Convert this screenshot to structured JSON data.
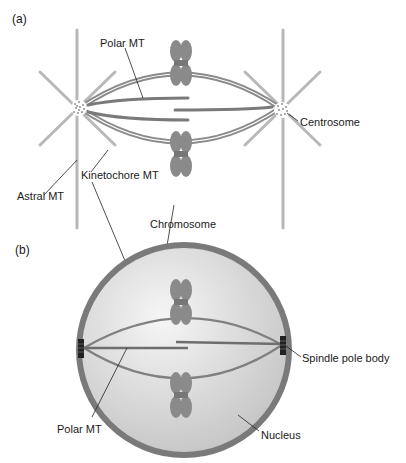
{
  "panels": {
    "a": {
      "label": "(a)",
      "labels": {
        "polar_mt": "Polar MT",
        "centrosome": "Centrosome",
        "astral_mt": "Astral MT",
        "kinetochore_mt": "Kinetochore MT",
        "chromosome": "Chromosome"
      }
    },
    "b": {
      "label": "(b)",
      "labels": {
        "spindle_pole_body": "Spindle pole body",
        "polar_mt": "Polar MT",
        "nucleus": "Nucleus"
      }
    }
  },
  "colors": {
    "microtubule": "#7f7f7f",
    "microtubule_light": "#b5b5b5",
    "chromosome": "#8a8a8a",
    "nuclear_envelope": "#7a7a7a",
    "nucleus_fill_light": "#f4f4f4",
    "nucleus_fill_dark": "#c8c8c8",
    "spindle_pole_body": "#222222",
    "leader_line": "#222222"
  }
}
